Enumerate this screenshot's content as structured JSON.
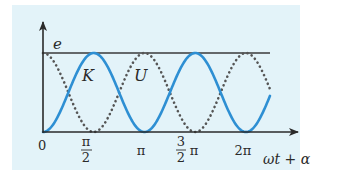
{
  "chart_data": {
    "type": "line",
    "title": "",
    "xlabel": "ωt + α",
    "ylabel": "e",
    "x_ticks": [
      "0",
      "π/2",
      "π",
      "3/2 π",
      "2π"
    ],
    "x_tick_values_rad": [
      0,
      1.5708,
      3.1416,
      4.7124,
      6.2832
    ],
    "x_range_rad": [
      0,
      7.38
    ],
    "y_range": [
      0,
      1
    ],
    "grid": false,
    "series": [
      {
        "name": "K",
        "style": "solid",
        "color": "#2e8fd3",
        "formula": "e*sin^2(ωt+α)",
        "x": [
          0,
          0.785,
          1.571,
          2.356,
          3.142,
          3.927,
          4.712,
          5.498,
          6.283,
          7.069
        ],
        "values": [
          0,
          0.5,
          1,
          0.5,
          0,
          0.5,
          1,
          0.5,
          0,
          0.5
        ]
      },
      {
        "name": "U",
        "style": "dotted",
        "color": "#555555",
        "formula": "e*cos^2(ωt+α)",
        "x": [
          0,
          0.785,
          1.571,
          2.356,
          3.142,
          3.927,
          4.712,
          5.498,
          6.283,
          7.069
        ],
        "values": [
          1,
          0.5,
          0,
          0.5,
          1,
          0.5,
          0,
          0.5,
          1,
          0.5
        ]
      }
    ],
    "annotations": [
      {
        "text": "K",
        "near": "first solid peak"
      },
      {
        "text": "U",
        "near": "dotted peak at π"
      },
      {
        "text": "e",
        "near": "top horizontal line (total energy)"
      }
    ],
    "reference_lines": [
      {
        "label": "e",
        "y": 1
      }
    ]
  },
  "labels": {
    "y_axis": "e",
    "x_axis": "ωt + α",
    "curve_k": "K",
    "curve_u": "U",
    "tick_0": "0",
    "tick_half_pi_num": "π",
    "tick_half_pi_den": "2",
    "tick_pi": "π",
    "tick_3half_num": "3",
    "tick_3half_den": "2",
    "tick_3half_pi": "π",
    "tick_2pi": "2π"
  },
  "colors": {
    "panel_bg": "#e3f3f9",
    "solid_curve": "#2e8fd3",
    "dotted_curve": "#555555",
    "axis": "#2a2a2a"
  }
}
